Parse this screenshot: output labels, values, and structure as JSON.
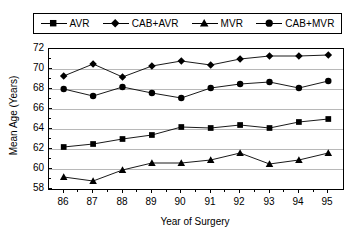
{
  "chart_data": {
    "type": "line",
    "title": "",
    "xlabel": "Year of Surgery",
    "ylabel": "Mean Age (Years)",
    "x": [
      86,
      87,
      88,
      89,
      90,
      91,
      92,
      93,
      94,
      95
    ],
    "categories": [
      "86",
      "87",
      "88",
      "89",
      "90",
      "91",
      "92",
      "93",
      "94",
      "95"
    ],
    "xlim": [
      85.5,
      95.5
    ],
    "ylim": [
      58,
      72
    ],
    "yticks": [
      58,
      60,
      62,
      64,
      66,
      68,
      70,
      72
    ],
    "ytick_labels": [
      "58",
      "60",
      "62",
      "64",
      "66",
      "68",
      "70",
      "72"
    ],
    "grid": true,
    "grid_axis": "y",
    "legend_position": "top",
    "series": [
      {
        "name": "AVR",
        "marker": "square",
        "values": [
          62.2,
          62.5,
          63.0,
          63.4,
          64.2,
          64.1,
          64.4,
          64.1,
          64.7,
          65.0
        ]
      },
      {
        "name": "CAB+AVR",
        "marker": "diamond",
        "values": [
          69.3,
          70.5,
          69.2,
          70.3,
          70.8,
          70.4,
          71.0,
          71.3,
          71.3,
          71.4
        ]
      },
      {
        "name": "MVR",
        "marker": "triangle",
        "values": [
          59.2,
          58.8,
          59.9,
          60.6,
          60.6,
          60.9,
          61.6,
          60.5,
          60.9,
          61.6
        ]
      },
      {
        "name": "CAB+MVR",
        "marker": "circle",
        "values": [
          68.0,
          67.3,
          68.2,
          67.6,
          67.1,
          68.1,
          68.5,
          68.7,
          68.1,
          68.8
        ]
      }
    ]
  },
  "legend": {
    "entries": [
      {
        "label": "AVR",
        "marker": "square"
      },
      {
        "label": "CAB+AVR",
        "marker": "diamond"
      },
      {
        "label": "MVR",
        "marker": "triangle"
      },
      {
        "label": "CAB+MVR",
        "marker": "circle"
      }
    ]
  },
  "colors": {
    "line": "#000000",
    "marker": "#000000",
    "grid": "#b8b8b8",
    "axis": "#000000",
    "background": "#ffffff"
  }
}
